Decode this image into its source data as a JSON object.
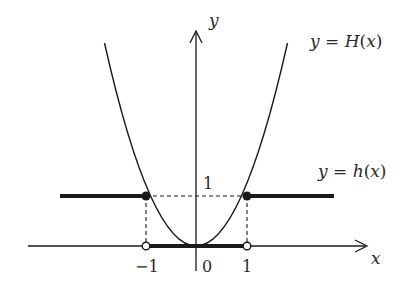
{
  "diagram": {
    "type": "function-graph",
    "axes": {
      "x_label": "x",
      "y_label": "y",
      "x_ticks": [
        "-1",
        "0",
        "1"
      ],
      "y_ticks": [
        "1"
      ]
    },
    "curves": [
      {
        "name": "H",
        "label": "y = H(x)",
        "label_parts": {
          "lhs": "y",
          "eq": " = ",
          "fn": "H",
          "open": "(",
          "arg": "x",
          "close": ")"
        },
        "description": "parabola y = x^2",
        "style": "thin"
      },
      {
        "name": "h",
        "label": "y = h(x)",
        "label_parts": {
          "lhs": "y",
          "eq": " = ",
          "fn": "h",
          "open": "(",
          "arg": "x",
          "close": ")"
        },
        "description": "piecewise: 0 on (-1,1), 1 for |x| >= 1",
        "style": "thick"
      }
    ],
    "points": [
      {
        "x": -1,
        "y": 1,
        "type": "filled"
      },
      {
        "x": 1,
        "y": 1,
        "type": "filled"
      },
      {
        "x": -1,
        "y": 0,
        "type": "open"
      },
      {
        "x": 1,
        "y": 0,
        "type": "open"
      }
    ],
    "guides": "dashed lines at y=1 and x=±1",
    "colors": {
      "stroke": "#1a1a1a",
      "text": "#2a2a2a",
      "background": "#ffffff"
    }
  }
}
